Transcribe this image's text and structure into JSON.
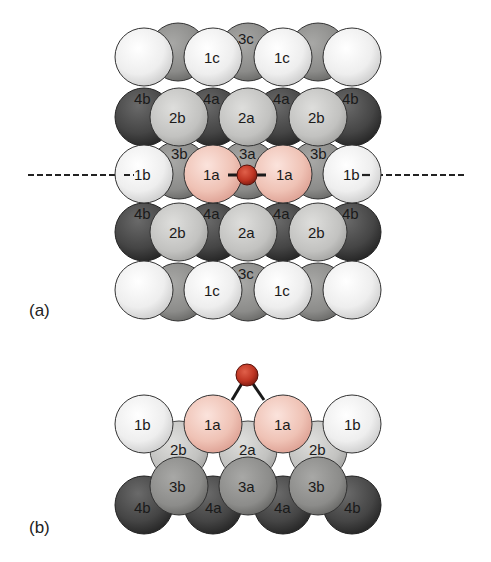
{
  "colors": {
    "surface_light": "#f4f4f4",
    "layer2": "#c8c8c6",
    "layer3": "#8e8e8c",
    "layer4": "#3e3e3e",
    "adsorbate_neighbor": "#f0c6ba",
    "oxygen": "#c0392b",
    "outline": "#333333"
  },
  "panel_a": {
    "label": "(a)",
    "rows": [
      {
        "name": "row1",
        "atoms": [
          "",
          "1c",
          "1c",
          ""
        ],
        "back_label": "3c"
      },
      {
        "name": "row2",
        "atoms": [
          "2b",
          "2a",
          "2b"
        ],
        "back_labels": [
          "4b",
          "4a",
          "4a",
          "4b"
        ]
      },
      {
        "name": "row3",
        "atoms": [
          "1b",
          "1a",
          "1a",
          "1b"
        ],
        "back_labels": [
          "3b",
          "3a",
          "3b"
        ]
      },
      {
        "name": "row4",
        "atoms": [
          "2b",
          "2a",
          "2b"
        ],
        "back_labels": [
          "4b",
          "4a",
          "4a",
          "4b"
        ]
      },
      {
        "name": "row5",
        "atoms": [
          "",
          "1c",
          "1c",
          ""
        ],
        "back_label": "3c"
      }
    ],
    "cut_line": "dashed"
  },
  "panel_b": {
    "label": "(b)",
    "layer1": [
      "1b",
      "1a",
      "1a",
      "1b"
    ],
    "layer2": [
      "2b",
      "2a",
      "2b"
    ],
    "layer3": [
      "3b",
      "3a",
      "3b"
    ],
    "layer4": [
      "4b",
      "4a",
      "4a",
      "4b"
    ]
  },
  "labels": {
    "a_r1_1": "1c",
    "a_r1_2": "1c",
    "a_3c_top": "3c",
    "a_4b_l1": "4b",
    "a_4a_1": "4a",
    "a_4a_2": "4a",
    "a_4b_r1": "4b",
    "a_2b_l1": "2b",
    "a_2a_1": "2a",
    "a_2b_r1": "2b",
    "a_3b_l": "3b",
    "a_3a": "3a",
    "a_3b_r": "3b",
    "a_1b_l": "1b",
    "a_1a_l": "1a",
    "a_1a_r": "1a",
    "a_1b_r": "1b",
    "a_4b_l2": "4b",
    "a_4a_3": "4a",
    "a_4a_4": "4a",
    "a_4b_r2": "4b",
    "a_2b_l2": "2b",
    "a_2a_2": "2a",
    "a_2b_r2": "2b",
    "a_3c_bot": "3c",
    "a_r5_1": "1c",
    "a_r5_2": "1c",
    "b_1b_l": "1b",
    "b_1a_l": "1a",
    "b_1a_r": "1a",
    "b_1b_r": "1b",
    "b_2b_l": "2b",
    "b_2a": "2a",
    "b_2b_r": "2b",
    "b_3b_l": "3b",
    "b_3a": "3a",
    "b_3b_r": "3b",
    "b_4b_l": "4b",
    "b_4a_l": "4a",
    "b_4a_r": "4a",
    "b_4b_r": "4b"
  }
}
